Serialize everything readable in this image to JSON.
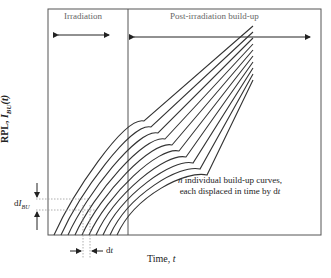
{
  "diagram": {
    "regions": {
      "irradiation": "Irradiation",
      "post": "Post-irradiation build-up"
    },
    "axes": {
      "ylabel_prefix": "RPL, ",
      "ylabel_sym": "I",
      "ylabel_sub": "BU",
      "ylabel_arg": "(t)",
      "xlabel_prefix": "Time, ",
      "xlabel_sym": "t"
    },
    "annotations": {
      "dI_d": "d",
      "dI_sym": "I",
      "dI_sub": "BU",
      "dt_d": "d",
      "dt_sym": "t",
      "note_n": "n",
      "note_line1": " individual build-up curves,",
      "note_line2": "each displaced in time by d",
      "note_line2_sym": "t"
    },
    "curves": {
      "count": 10,
      "displacement_px": 7
    },
    "colors": {
      "frame": "#555555",
      "curve": "#333333",
      "dotted": "#999999",
      "text": "#222222"
    }
  }
}
